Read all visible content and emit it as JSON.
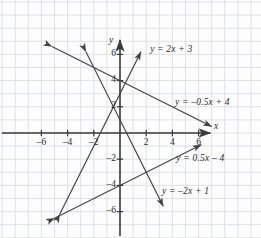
{
  "figure": {
    "background_color": "#fdfdfd",
    "grid_color": "#dcdee2",
    "axis_color": "#3a3a3a",
    "line_color": "#444444",
    "text_color": "#2a2a2a"
  },
  "axes": {
    "x_name": "x",
    "y_name": "y",
    "origin_px": {
      "x": 120,
      "y": 133
    },
    "unit_px": 13.1,
    "x_ticks": [
      {
        "value": -6,
        "label": "–6"
      },
      {
        "value": -4,
        "label": "–4"
      },
      {
        "value": -2,
        "label": "–2"
      },
      {
        "value": 2,
        "label": "2"
      },
      {
        "value": 4,
        "label": "4"
      },
      {
        "value": 6,
        "label": "6"
      }
    ],
    "y_ticks": [
      {
        "value": 6,
        "label": "6"
      },
      {
        "value": 4,
        "label": "4"
      },
      {
        "value": 2,
        "label": "2"
      },
      {
        "value": -2,
        "label": "–2"
      },
      {
        "value": -4,
        "label": "–4"
      },
      {
        "value": -6,
        "label": "–6"
      }
    ]
  },
  "chart_data": {
    "type": "line",
    "title": "",
    "xlabel": "x",
    "ylabel": "y",
    "xlim": [
      -7.6,
      7.6
    ],
    "ylim": [
      -7.2,
      7.6
    ],
    "grid": true,
    "grid_step": 1,
    "legend": "inline-annotations",
    "series": [
      {
        "name": "y = 2x + 3",
        "label": "y = 2x + 3",
        "slope": 2,
        "intercept": 3,
        "x": [
          -4.6,
          1.6
        ],
        "y": [
          -6.2,
          6.2
        ],
        "arrows": "both",
        "label_anchor": {
          "x": 2.3,
          "y": 6.3
        }
      },
      {
        "name": "y = -0.5x + 4",
        "label": "y = –0.5x + 4",
        "slope": -0.5,
        "intercept": 4,
        "x": [
          -5.2,
          7.0
        ],
        "y": [
          6.6,
          0.5
        ],
        "arrows": "both",
        "label_anchor": {
          "x": 4.2,
          "y": 2.3
        }
      },
      {
        "name": "y = 0.5x - 4",
        "label": "y = 0.5x – 4",
        "slope": 0.5,
        "intercept": -4,
        "x": [
          -5.0,
          6.2
        ],
        "y": [
          -6.5,
          -0.9
        ],
        "arrows": "both",
        "label_anchor": {
          "x": 4.3,
          "y": -2.0
        }
      },
      {
        "name": "y = -2x + 1",
        "label": "y = –2x + 1",
        "slope": -2,
        "intercept": 1,
        "x": [
          -2.6,
          3.3
        ],
        "y": [
          6.2,
          -5.6
        ],
        "arrows": "both",
        "label_anchor": {
          "x": 3.2,
          "y": -4.5
        }
      }
    ]
  }
}
